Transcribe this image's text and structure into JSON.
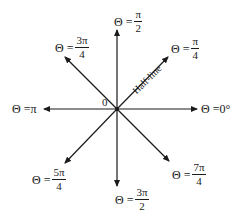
{
  "diagram": {
    "title": "",
    "origin_label": "0",
    "halfline_label": "Half-line",
    "colors": {
      "line": "#1a1a1a",
      "background": "#ffffff"
    },
    "rays": [
      {
        "id": "0",
        "prefix": "Θ = ",
        "value": "0°",
        "num": "",
        "den": ""
      },
      {
        "id": "pi4",
        "prefix": "Θ =",
        "value": "",
        "num": "π",
        "den": "4"
      },
      {
        "id": "pi2",
        "prefix": "Θ =",
        "value": "",
        "num": "π",
        "den": "2"
      },
      {
        "id": "3pi4",
        "prefix": "Θ =",
        "value": "",
        "num": "3π",
        "den": "4"
      },
      {
        "id": "pi",
        "prefix": "Θ = ",
        "value": "π",
        "num": "",
        "den": ""
      },
      {
        "id": "5pi4",
        "prefix": "Θ =",
        "value": "",
        "num": "5π",
        "den": "4"
      },
      {
        "id": "3pi2",
        "prefix": "Θ =",
        "value": "",
        "num": "3π",
        "den": "2"
      },
      {
        "id": "7pi4",
        "prefix": "Θ =",
        "value": "",
        "num": "7π",
        "den": "4"
      }
    ]
  }
}
